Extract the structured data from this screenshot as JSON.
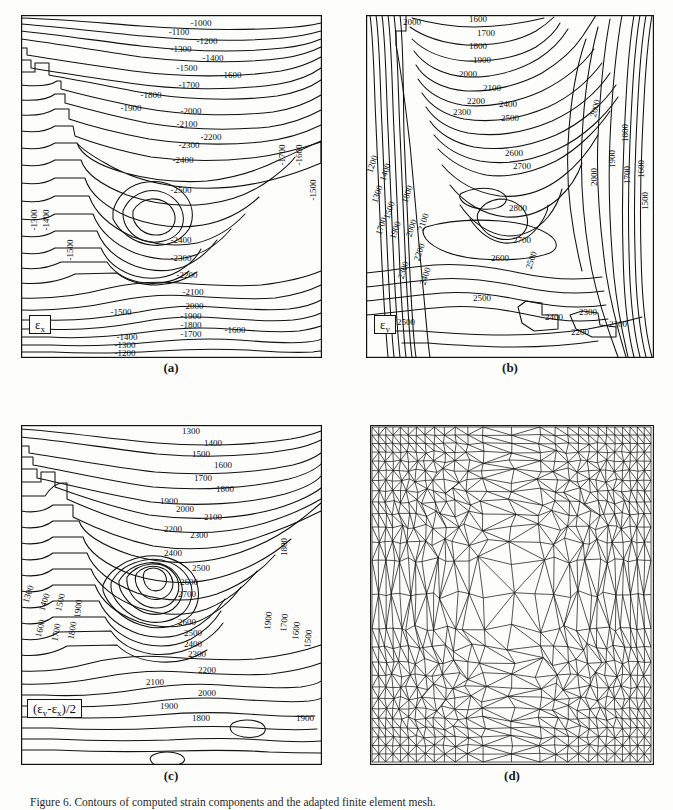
{
  "figure": {
    "caption_number": "Figure 6.",
    "caption_text": "Contours of computed strain components and the adapted finite element mesh.",
    "background_color": "#fdfdfc",
    "line_color": "#111111"
  },
  "panels": [
    {
      "id": "a",
      "label": "(a)",
      "quantity_label": "εx",
      "quantity_symbol": "ε",
      "quantity_subscript": "x",
      "sign": "negative",
      "box": {
        "x": 21,
        "y": 15,
        "w": 301,
        "h": 343
      },
      "label_pos": {
        "x": 171,
        "y": 366
      }
    },
    {
      "id": "b",
      "label": "(b)",
      "quantity_label": "εy",
      "quantity_symbol": "ε",
      "quantity_subscript": "y",
      "sign": "positive",
      "box": {
        "x": 366,
        "y": 15,
        "w": 288,
        "h": 343
      },
      "label_pos": {
        "x": 510,
        "y": 366
      }
    },
    {
      "id": "c",
      "label": "(c)",
      "quantity_label": "(εy-εx)/2",
      "sign": "positive",
      "box": {
        "x": 21,
        "y": 425,
        "w": 301,
        "h": 340
      },
      "label_pos": {
        "x": 171,
        "y": 773
      }
    },
    {
      "id": "d",
      "label": "(d)",
      "quantity_label": "adapted mesh",
      "box": {
        "x": 370,
        "y": 425,
        "w": 284,
        "h": 340
      },
      "label_pos": {
        "x": 512,
        "y": 773
      }
    }
  ],
  "chart_data": [
    {
      "type": "contour",
      "panel": "a",
      "title": "εx strain contours",
      "units": "microstrain",
      "levels": [
        -2500,
        -2400,
        -2300,
        -2200,
        -2100,
        -2000,
        -1900,
        -1800,
        -1700,
        -1600,
        -1500,
        -1400,
        -1300,
        -1200,
        -1100,
        -1000
      ],
      "interval": 100,
      "extreme": {
        "type": "minimum",
        "value": -2500,
        "location": "center"
      },
      "top_labels": [
        "-1000",
        "-1100",
        "-1200",
        "-1300",
        "-1400",
        "-1500",
        "-1600",
        "-1700",
        "-1800",
        "-1900",
        "-2000",
        "-2100",
        "-2200",
        "-2300",
        "-2400",
        "-2500"
      ],
      "bottom_labels": [
        "-1500",
        "-1600",
        "-1700",
        "-1800",
        "-1900",
        "-2000",
        "-2100",
        "-2200",
        "-2300",
        "-2400",
        "-1400",
        "-1300",
        "-1200",
        "-1100"
      ],
      "left_edge_labels": [
        "-1300",
        "-1400",
        "-1500"
      ],
      "right_edge_labels": [
        "-1700",
        "-1600",
        "-1500"
      ],
      "grid": false,
      "legend": "none"
    },
    {
      "type": "contour",
      "panel": "b",
      "title": "εy strain contours",
      "units": "microstrain",
      "levels": [
        1200,
        1300,
        1400,
        1500,
        1600,
        1700,
        1800,
        1900,
        2000,
        2100,
        2200,
        2300,
        2400,
        2500,
        2600,
        2700,
        2800
      ],
      "interval": 100,
      "extreme": {
        "type": "maximum",
        "value": 2800,
        "location": "center"
      },
      "top_labels": [
        "1600",
        "1700",
        "1800",
        "1900",
        "2000",
        "2100",
        "2200",
        "2300",
        "2400",
        "2500",
        "2600",
        "2700",
        "2800"
      ],
      "left_edge_labels": [
        "1200",
        "1300",
        "1400",
        "1500",
        "1600",
        "1700",
        "1800",
        "1900",
        "2000",
        "2100",
        "2200",
        "2300",
        "2400",
        "2500"
      ],
      "right_edge_labels": [
        "2000",
        "1900",
        "1800",
        "1700",
        "1600",
        "1500"
      ],
      "bottom_labels": [
        "2500",
        "2400",
        "2300",
        "2200",
        "2100",
        "2500",
        "2600",
        "2700",
        "2800"
      ],
      "grid": false,
      "legend": "none"
    },
    {
      "type": "contour",
      "panel": "c",
      "title": "(εy-εx)/2 shear strain contours",
      "units": "microstrain",
      "levels": [
        1300,
        1400,
        1500,
        1600,
        1700,
        1800,
        1900,
        2000,
        2100,
        2200,
        2300,
        2400,
        2500,
        2600,
        2700
      ],
      "interval": 100,
      "extreme": {
        "type": "maximum",
        "value": 2700,
        "location": "center"
      },
      "top_labels": [
        "1300",
        "1400",
        "1500",
        "1600",
        "1700",
        "1800",
        "1900",
        "2000",
        "2100",
        "2200",
        "2300",
        "2400",
        "2500",
        "2600",
        "2700"
      ],
      "left_edge_labels": [
        "1300",
        "1400",
        "1500",
        "1600",
        "1700",
        "1800",
        "1900"
      ],
      "right_edge_labels": [
        "1800",
        "1900",
        "1700",
        "1600",
        "1500"
      ],
      "bottom_labels": [
        "2600",
        "2500",
        "2400",
        "2300",
        "2200",
        "2100",
        "2000",
        "1900",
        "1800",
        "1900"
      ],
      "grid": false,
      "legend": "none"
    },
    {
      "type": "mesh",
      "panel": "d",
      "title": "Adapted triangular finite element mesh",
      "element_type": "triangle",
      "refinement": "graded, refined toward centre",
      "grid": false,
      "legend": "none"
    }
  ]
}
